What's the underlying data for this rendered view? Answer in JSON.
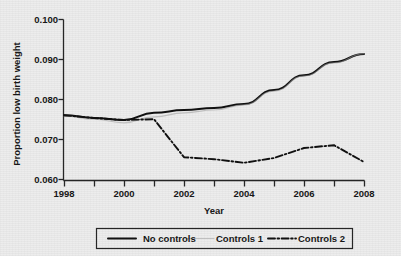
{
  "chart_data": {
    "type": "line",
    "title": "",
    "xlabel": "Year",
    "ylabel": "Proportion low birth weight",
    "xlim": [
      1998,
      2008
    ],
    "ylim": [
      0.06,
      0.1
    ],
    "grid": false,
    "legend_position": "bottom",
    "x": [
      1998,
      1999,
      2000,
      2001,
      2002,
      2003,
      2004,
      2005,
      2006,
      2007,
      2008
    ],
    "xticks": [
      "1998",
      "2000",
      "2002",
      "2004",
      "2006",
      "2008"
    ],
    "xtick_values": [
      1998,
      2000,
      2002,
      2004,
      2006,
      2008
    ],
    "xminor_values": [
      1999,
      2001,
      2003,
      2005,
      2007
    ],
    "yticks": [
      "0.060",
      "0.070",
      "0.080",
      "0.090",
      "0.100"
    ],
    "ytick_values": [
      0.06,
      0.07,
      0.08,
      0.09,
      0.1
    ],
    "series": [
      {
        "name": "No controls",
        "style": "solid",
        "color": "#101010",
        "values": [
          0.0762,
          0.0755,
          0.075,
          0.0768,
          0.0775,
          0.078,
          0.079,
          0.0825,
          0.0862,
          0.0895,
          0.0915
        ]
      },
      {
        "name": "Controls 1",
        "style": "solid-faint",
        "color": "#9a9a9a",
        "values": [
          0.076,
          0.0752,
          0.0743,
          0.0758,
          0.0768,
          0.0775,
          0.0788,
          0.0822,
          0.086,
          0.0893,
          0.0916
        ]
      },
      {
        "name": "Controls 2",
        "style": "dash-dot",
        "color": "#101010",
        "values": [
          0.0762,
          0.0755,
          0.075,
          0.0752,
          0.0657,
          0.0652,
          0.0643,
          0.0655,
          0.068,
          0.0687,
          0.0645
        ]
      }
    ]
  },
  "legend": {
    "items": [
      {
        "label": "No controls",
        "style": "solid",
        "color": "#101010"
      },
      {
        "label": "Controls 1",
        "style": "solid-faint",
        "color": "#9a9a9a"
      },
      {
        "label": "Controls 2",
        "style": "dash-dot",
        "color": "#101010"
      }
    ]
  },
  "axis": {
    "y_title": "Proportion low birth weight",
    "x_title": "Year",
    "y_tick_0": "0.060",
    "y_tick_1": "0.070",
    "y_tick_2": "0.080",
    "y_tick_3": "0.090",
    "y_tick_4": "0.100",
    "x_tick_0": "1998",
    "x_tick_1": "2000",
    "x_tick_2": "2002",
    "x_tick_3": "2004",
    "x_tick_4": "2006",
    "x_tick_5": "2008"
  }
}
